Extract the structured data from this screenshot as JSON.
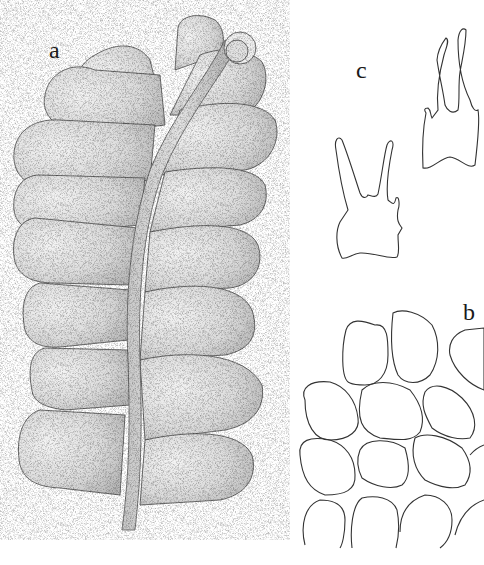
{
  "figure": {
    "type": "scientific-illustration",
    "panels": [
      {
        "id": "a",
        "label": "a",
        "description": "shoot habit, dorsal view, stippled leaves along central stem"
      },
      {
        "id": "b",
        "label": "b",
        "description": "leaf cells outline"
      },
      {
        "id": "c",
        "label": "c",
        "description": "two underleaves, bifid with lateral teeth"
      }
    ]
  },
  "colors": {
    "background": "#ffffff",
    "ink": "#2a2a2a"
  }
}
